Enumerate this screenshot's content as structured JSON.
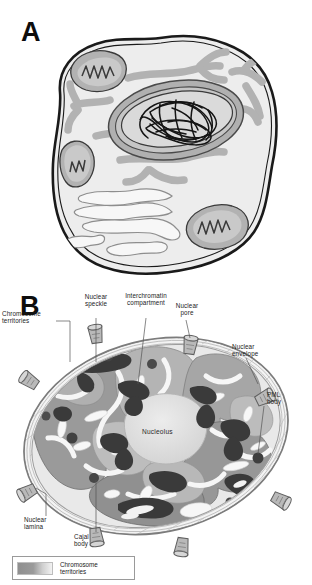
{
  "figure": {
    "type": "scientific-illustration",
    "style": "grayscale line drawing",
    "panels": [
      {
        "id": "A",
        "letter": "A",
        "caption": "",
        "description": "Schematic of a whole eukaryotic cell showing plasma membrane, cytoplasm, mitochondria, endoplasmic reticulum, Golgi apparatus and the nucleus containing condensed chromatin fibres.",
        "structures": [
          "plasma membrane",
          "cytoplasm",
          "mitochondrion",
          "endoplasmic reticulum",
          "Golgi apparatus",
          "nuclear envelope",
          "nucleus",
          "chromatin fibres"
        ]
      },
      {
        "id": "B",
        "letter": "B",
        "caption": "",
        "description": "Enlarged schematic of the cell nucleus showing chromosome territories, the interchromatin compartment, nuclear speckles, nucleolus, PML bodies, Cajal body, nuclear pores, nuclear envelope and nuclear lamina."
      }
    ]
  },
  "panel_b": {
    "labels": [
      {
        "key": "chromosome-territories-left",
        "text": "Chromosome\nterritories"
      },
      {
        "key": "nuclear-speckle",
        "text": "Nuclear\nspeckle"
      },
      {
        "key": "interchromatin-compartment",
        "text": "Interchromatin\ncompartment"
      },
      {
        "key": "nuclear-pore",
        "text": "Nuclear\npore"
      },
      {
        "key": "nuclear-envelope",
        "text": "Nuclear\nenvelope"
      },
      {
        "key": "pml-body",
        "text": "PML\nbody"
      },
      {
        "key": "nuclear-lamina",
        "text": "Nuclear\nlamina"
      },
      {
        "key": "cajal-body",
        "text": "Cajal\nbody"
      }
    ],
    "nucleolus_label": "Nucleolus",
    "legend": {
      "swatch": "gradient-gray",
      "text": "Chromosome\nterritories"
    }
  },
  "colors": {
    "ink": "#1b1b1b",
    "outline": "#111111",
    "cytoplasm": "#eaeaea",
    "organelle_gray": "#b4b4b4",
    "nucleoplasm_light": "#e6e6e6",
    "territory_dark": "#8f8f8f",
    "territory_mid": "#a8a8a8",
    "territory_light": "#c9c9c9",
    "speckle_dark": "#3d3d3d",
    "nucleolus": "#dcdcdc",
    "envelope": "#9a9a9a",
    "white": "#ffffff"
  }
}
